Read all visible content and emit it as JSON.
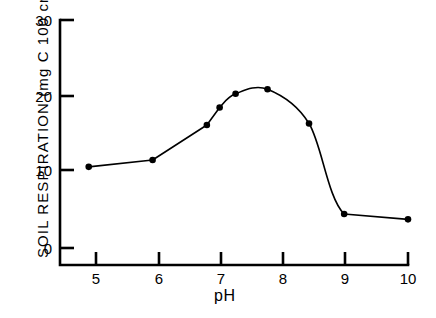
{
  "figure": {
    "name": "soil-respiration-vs-ph-figure",
    "background_color": "#ffffff",
    "line_color": "#000000",
    "marker_color": "#000000"
  },
  "axes": {
    "x_title": "pH",
    "y_title_prefix": "SOIL  RESPIRATION  (mg C 100 cm",
    "y_title_exponent": "-2",
    "y_title_suffix": ")",
    "x_ticks": [
      "5",
      "6",
      "7",
      "8",
      "9",
      "10"
    ],
    "y_ticks": [
      "0",
      "10",
      "20",
      "30"
    ]
  },
  "chart_data": {
    "type": "line",
    "title": "",
    "xlabel": "pH",
    "ylabel": "SOIL RESPIRATION (mg C 100 cm-2)",
    "xlim": [
      4.55,
      10.0
    ],
    "ylim": [
      -2.2,
      30.0
    ],
    "xticks": [
      5,
      6,
      7,
      8,
      9,
      10
    ],
    "yticks": [
      0,
      10,
      20,
      30
    ],
    "grid": false,
    "legend": null,
    "marker": "filled-circle",
    "series": [
      {
        "name": "Soil respiration",
        "x": [
          5.0,
          6.0,
          6.85,
          7.05,
          7.3,
          7.8,
          8.45,
          9.0,
          10.0
        ],
        "y": [
          10.7,
          11.6,
          16.2,
          18.5,
          20.3,
          20.9,
          16.4,
          4.5,
          3.8
        ]
      }
    ]
  }
}
